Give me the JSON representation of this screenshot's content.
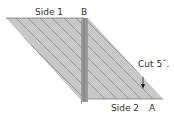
{
  "diagram": {
    "labels": {
      "side1": "Side 1",
      "side2": "Side 2",
      "point_a": "A",
      "point_b": "B",
      "cut": "Cut 5˝."
    },
    "colors": {
      "fabric_fill": "#c8c8c8",
      "stripe": "#8a8a8a",
      "edge": "#7a7a7a",
      "seam_strip": "#9a9a9a",
      "text": "#333333"
    }
  }
}
